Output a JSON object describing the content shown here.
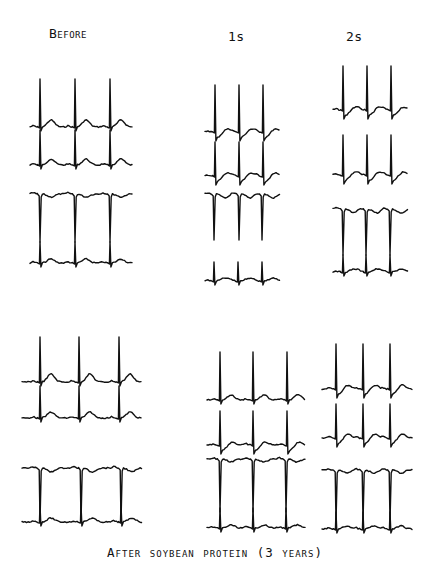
{
  "figure": {
    "column_labels": [
      "Before",
      "1s",
      "2s"
    ],
    "caption": "After soybean protein (3 years)",
    "ink_color": "#111111",
    "background_color": "#ffffff"
  },
  "panels": [
    {
      "row": "top",
      "column": "Before",
      "traces": [
        {
          "baseline": 127,
          "peak": 79,
          "type": "upright",
          "beats_x": [
            40,
            75,
            110
          ],
          "x_start": 30,
          "x_end": 133,
          "t_wave": 7
        },
        {
          "baseline": 165,
          "peak": 130,
          "type": "upright",
          "beats_x": [
            40,
            75,
            110
          ],
          "x_start": 30,
          "x_end": 133,
          "t_wave": 6
        },
        {
          "baseline": 194,
          "peak": 242,
          "type": "inverted",
          "beats_x": [
            40,
            75,
            110
          ],
          "x_start": 30,
          "x_end": 133,
          "t_wave": -3
        },
        {
          "baseline": 263,
          "peak": 242,
          "type": "upright",
          "beats_x": [
            40,
            75,
            110
          ],
          "x_start": 30,
          "x_end": 133,
          "t_wave": 4
        }
      ]
    },
    {
      "row": "top",
      "column": "1s",
      "traces": [
        {
          "baseline": 132,
          "peak": 85,
          "type": "upright-depressed",
          "beats_x": [
            215,
            239,
            263
          ],
          "x_start": 205,
          "x_end": 280,
          "t_wave": 4
        },
        {
          "baseline": 176,
          "peak": 142,
          "type": "upright-depressed",
          "beats_x": [
            215,
            239,
            263
          ],
          "x_start": 205,
          "x_end": 280,
          "t_wave": 4
        },
        {
          "baseline": 194,
          "peak": 240,
          "type": "inverted",
          "beats_x": [
            214,
            239,
            262
          ],
          "x_start": 205,
          "x_end": 280,
          "t_wave": -4
        },
        {
          "baseline": 281,
          "peak": 262,
          "type": "upright",
          "beats_x": [
            214,
            238,
            262
          ],
          "x_start": 205,
          "x_end": 280,
          "t_wave": 3
        }
      ]
    },
    {
      "row": "top",
      "column": "2s",
      "traces": [
        {
          "baseline": 110,
          "peak": 66,
          "type": "upright-depressed",
          "beats_x": [
            343,
            367,
            391
          ],
          "x_start": 333,
          "x_end": 408,
          "t_wave": 4
        },
        {
          "baseline": 175,
          "peak": 135,
          "type": "upright-depressed",
          "beats_x": [
            343,
            367,
            391
          ],
          "x_start": 333,
          "x_end": 408,
          "t_wave": 4
        },
        {
          "baseline": 209,
          "peak": 255,
          "type": "inverted",
          "beats_x": [
            343,
            366,
            390
          ],
          "x_start": 333,
          "x_end": 408,
          "t_wave": -4
        },
        {
          "baseline": 272,
          "peak": 255,
          "type": "upright",
          "beats_x": [
            343,
            366,
            390
          ],
          "x_start": 333,
          "x_end": 408,
          "t_wave": 3
        }
      ]
    },
    {
      "row": "bottom",
      "column": "Before",
      "traces": [
        {
          "baseline": 382,
          "peak": 337,
          "type": "upright",
          "beats_x": [
            40,
            79,
            119
          ],
          "x_start": 22,
          "x_end": 142,
          "t_wave": 8
        },
        {
          "baseline": 418,
          "peak": 386,
          "type": "upright",
          "beats_x": [
            40,
            79,
            119
          ],
          "x_start": 22,
          "x_end": 142,
          "t_wave": 6
        },
        {
          "baseline": 468,
          "peak": 522,
          "type": "inverted",
          "beats_x": [
            40,
            81,
            121
          ],
          "x_start": 22,
          "x_end": 142,
          "t_wave": -4
        },
        {
          "baseline": 522,
          "peak": 505,
          "type": "upright",
          "beats_x": [
            40,
            81,
            121
          ],
          "x_start": 22,
          "x_end": 142,
          "t_wave": 4
        }
      ]
    },
    {
      "row": "bottom",
      "column": "1s",
      "traces": [
        {
          "baseline": 400,
          "peak": 352,
          "type": "upright",
          "beats_x": [
            220,
            253,
            287
          ],
          "x_start": 207,
          "x_end": 305,
          "t_wave": 5
        },
        {
          "baseline": 445,
          "peak": 411,
          "type": "upright-depressed",
          "beats_x": [
            220,
            253,
            287
          ],
          "x_start": 207,
          "x_end": 305,
          "t_wave": 4
        },
        {
          "baseline": 459,
          "peak": 512,
          "type": "inverted",
          "beats_x": [
            220,
            253,
            286
          ],
          "x_start": 207,
          "x_end": 305,
          "t_wave": -3
        },
        {
          "baseline": 528,
          "peak": 508,
          "type": "upright",
          "beats_x": [
            220,
            253,
            286
          ],
          "x_start": 207,
          "x_end": 305,
          "t_wave": 3
        }
      ]
    },
    {
      "row": "bottom",
      "column": "2s",
      "traces": [
        {
          "baseline": 389,
          "peak": 344,
          "type": "upright-depressed",
          "beats_x": [
            336,
            363,
            390
          ],
          "x_start": 322,
          "x_end": 413,
          "t_wave": 5
        },
        {
          "baseline": 438,
          "peak": 404,
          "type": "upright-depressed",
          "beats_x": [
            336,
            363,
            390
          ],
          "x_start": 322,
          "x_end": 413,
          "t_wave": 5
        },
        {
          "baseline": 470,
          "peak": 522,
          "type": "inverted",
          "beats_x": [
            336,
            363,
            390
          ],
          "x_start": 322,
          "x_end": 413,
          "t_wave": -3
        },
        {
          "baseline": 529,
          "peak": 512,
          "type": "upright",
          "beats_x": [
            336,
            363,
            390
          ],
          "x_start": 322,
          "x_end": 413,
          "t_wave": 3
        }
      ]
    }
  ]
}
